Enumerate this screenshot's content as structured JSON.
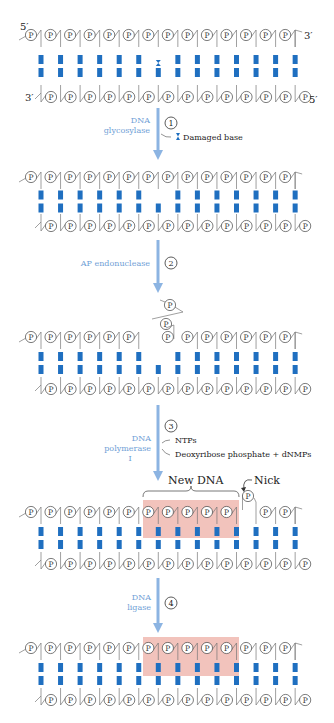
{
  "figure": {
    "colors": {
      "base_pair": "#1f6fc0",
      "arrow": "#8cb4e2",
      "enzyme_label": "#6fa0d6",
      "new_dna_highlight": "#f0b8b0",
      "backbone": "#777777"
    },
    "strand_ends": {
      "top_left": "5′",
      "top_right": "3′",
      "bottom_left": "3′",
      "bottom_right": "5′"
    },
    "phosphate_label": "P",
    "base_pair_count": 14
  },
  "steps": [
    {
      "number": "①",
      "enzyme": [
        "DNA",
        "glycosylase"
      ],
      "annotations": [
        "Damaged base"
      ]
    },
    {
      "number": "②",
      "enzyme": [
        "AP endonuclease"
      ],
      "annotations": []
    },
    {
      "number": "③",
      "enzyme": [
        "DNA",
        "polymerase",
        "I"
      ],
      "annotations": [
        "NTPs",
        "Deoxyribose phosphate + dNMPs"
      ]
    },
    {
      "number": "④",
      "enzyme": [
        "DNA",
        "ligase"
      ],
      "annotations": []
    }
  ],
  "callouts": {
    "new_dna": "New DNA",
    "nick": "Nick"
  },
  "states": [
    {
      "name": "original-duplex",
      "damaged_base_index": 6
    },
    {
      "name": "abasic-site",
      "missing_base_index": 6
    },
    {
      "name": "backbone-cleaved",
      "excised_fragment": true
    },
    {
      "name": "repaired-with-nick",
      "new_dna_range": [
        6,
        10
      ],
      "nick_after_index": 10
    },
    {
      "name": "sealed-duplex",
      "new_dna_range": [
        6,
        10
      ]
    }
  ]
}
